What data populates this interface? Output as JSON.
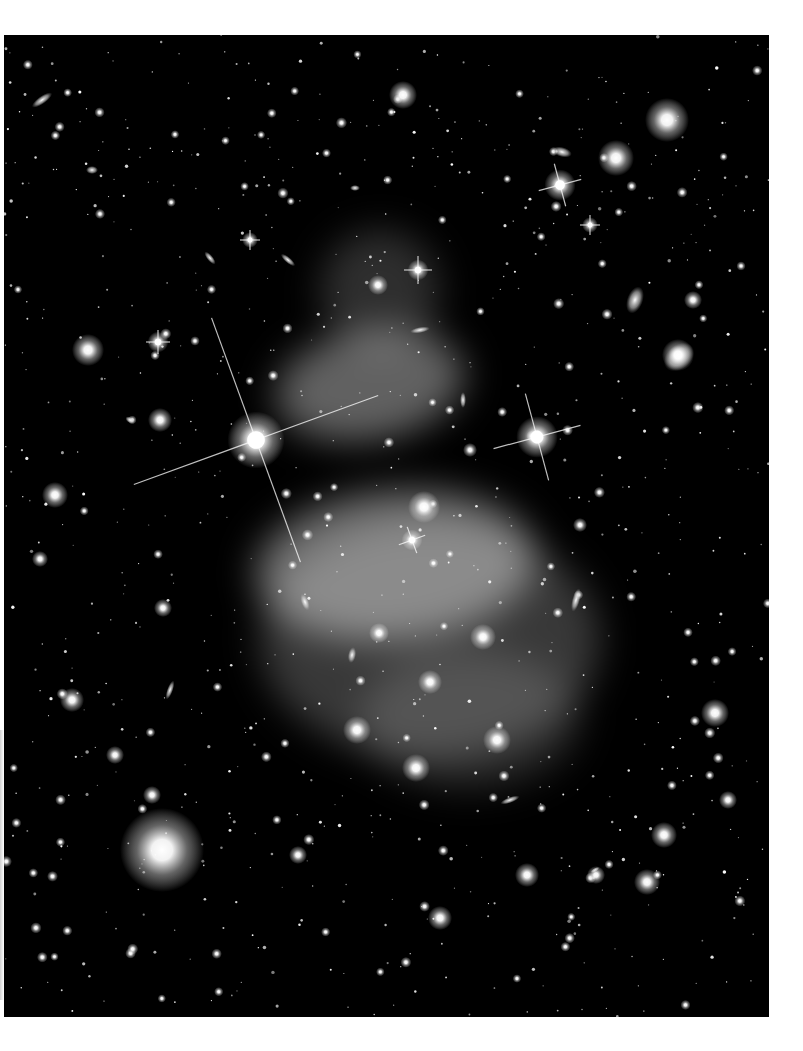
{
  "image": {
    "subject": "galaxy cluster deep field with intracluster light",
    "frame": {
      "x": 4,
      "y": 35,
      "width": 765,
      "height": 982,
      "background": "#000000"
    },
    "page_background": "#ffffff"
  },
  "nebula_glow": [
    {
      "cx": 370,
      "cy": 385,
      "rx": 95,
      "ry": 55,
      "opacity": 0.38,
      "rotate": -10
    },
    {
      "cx": 395,
      "cy": 565,
      "rx": 140,
      "ry": 75,
      "opacity": 0.42,
      "rotate": -5
    },
    {
      "cx": 430,
      "cy": 640,
      "rx": 170,
      "ry": 120,
      "opacity": 0.22,
      "rotate": 0
    },
    {
      "cx": 380,
      "cy": 290,
      "rx": 60,
      "ry": 60,
      "opacity": 0.18,
      "rotate": 0
    },
    {
      "cx": 470,
      "cy": 720,
      "rx": 110,
      "ry": 70,
      "opacity": 0.14,
      "rotate": 0
    }
  ],
  "spiked_stars": [
    {
      "cx": 256,
      "cy": 440,
      "r": 11,
      "spike": 130,
      "angle": -20
    },
    {
      "cx": 537,
      "cy": 437,
      "r": 8,
      "spike": 45,
      "angle": -15
    },
    {
      "cx": 560,
      "cy": 185,
      "r": 6,
      "spike": 22,
      "angle": -15
    },
    {
      "cx": 418,
      "cy": 270,
      "r": 4,
      "spike": 14,
      "angle": 0
    },
    {
      "cx": 158,
      "cy": 342,
      "r": 4,
      "spike": 12,
      "angle": 0
    },
    {
      "cx": 412,
      "cy": 540,
      "r": 4,
      "spike": 14,
      "angle": -20
    },
    {
      "cx": 590,
      "cy": 225,
      "r": 3,
      "spike": 10,
      "angle": 0
    },
    {
      "cx": 250,
      "cy": 240,
      "r": 3,
      "spike": 10,
      "angle": 0
    }
  ],
  "bright_halos": [
    {
      "cx": 162,
      "cy": 850,
      "r": 42
    },
    {
      "cx": 667,
      "cy": 120,
      "r": 22
    },
    {
      "cx": 616,
      "cy": 158,
      "r": 18
    },
    {
      "cx": 403,
      "cy": 95,
      "r": 14
    },
    {
      "cx": 88,
      "cy": 350,
      "r": 16
    },
    {
      "cx": 55,
      "cy": 495,
      "r": 13
    },
    {
      "cx": 160,
      "cy": 420,
      "r": 12
    },
    {
      "cx": 72,
      "cy": 700,
      "r": 12
    },
    {
      "cx": 357,
      "cy": 730,
      "r": 14
    },
    {
      "cx": 416,
      "cy": 768,
      "r": 14
    },
    {
      "cx": 483,
      "cy": 637,
      "r": 13
    },
    {
      "cx": 497,
      "cy": 740,
      "r": 14
    },
    {
      "cx": 430,
      "cy": 682,
      "r": 12
    },
    {
      "cx": 379,
      "cy": 633,
      "r": 10
    },
    {
      "cx": 424,
      "cy": 507,
      "r": 16
    },
    {
      "cx": 378,
      "cy": 285,
      "r": 10
    },
    {
      "cx": 715,
      "cy": 713,
      "r": 14
    },
    {
      "cx": 664,
      "cy": 835,
      "r": 13
    },
    {
      "cx": 647,
      "cy": 882,
      "r": 13
    },
    {
      "cx": 440,
      "cy": 918,
      "r": 12
    },
    {
      "cx": 527,
      "cy": 875,
      "r": 12
    },
    {
      "cx": 596,
      "cy": 875,
      "r": 9
    },
    {
      "cx": 693,
      "cy": 300,
      "r": 9
    },
    {
      "cx": 678,
      "cy": 355,
      "r": 16
    },
    {
      "cx": 163,
      "cy": 608,
      "r": 9
    },
    {
      "cx": 115,
      "cy": 755,
      "r": 9
    },
    {
      "cx": 152,
      "cy": 795,
      "r": 9
    },
    {
      "cx": 298,
      "cy": 855,
      "r": 9
    },
    {
      "cx": 40,
      "cy": 559,
      "r": 8
    },
    {
      "cx": 728,
      "cy": 800,
      "r": 9
    },
    {
      "cx": 580,
      "cy": 525,
      "r": 7
    },
    {
      "cx": 470,
      "cy": 450,
      "r": 7
    }
  ],
  "elongated_galaxies": [
    {
      "cx": 42,
      "cy": 100,
      "rx": 12,
      "ry": 4,
      "rotate": -35
    },
    {
      "cx": 679,
      "cy": 357,
      "rx": 17,
      "ry": 12,
      "rotate": -40
    },
    {
      "cx": 635,
      "cy": 300,
      "rx": 8,
      "ry": 14,
      "rotate": 20
    },
    {
      "cx": 562,
      "cy": 152,
      "rx": 10,
      "ry": 5,
      "rotate": 15
    },
    {
      "cx": 576,
      "cy": 600,
      "rx": 4,
      "ry": 12,
      "rotate": 15
    },
    {
      "cx": 510,
      "cy": 800,
      "rx": 10,
      "ry": 3,
      "rotate": -20
    },
    {
      "cx": 170,
      "cy": 690,
      "rx": 3,
      "ry": 10,
      "rotate": 20
    },
    {
      "cx": 130,
      "cy": 420,
      "rx": 5,
      "ry": 3,
      "rotate": 30
    },
    {
      "cx": 420,
      "cy": 330,
      "rx": 10,
      "ry": 3,
      "rotate": -10
    },
    {
      "cx": 463,
      "cy": 400,
      "rx": 3,
      "ry": 8,
      "rotate": 0
    },
    {
      "cx": 305,
      "cy": 602,
      "rx": 4,
      "ry": 9,
      "rotate": -20
    },
    {
      "cx": 210,
      "cy": 258,
      "rx": 3,
      "ry": 8,
      "rotate": -40
    },
    {
      "cx": 288,
      "cy": 260,
      "rx": 9,
      "ry": 3,
      "rotate": 40
    },
    {
      "cx": 355,
      "cy": 188,
      "rx": 5,
      "ry": 3,
      "rotate": 0
    },
    {
      "cx": 352,
      "cy": 655,
      "rx": 4,
      "ry": 8,
      "rotate": 10
    },
    {
      "cx": 595,
      "cy": 870,
      "rx": 5,
      "ry": 2,
      "rotate": -30
    },
    {
      "cx": 92,
      "cy": 170,
      "rx": 6,
      "ry": 4,
      "rotate": 0
    }
  ],
  "star_field": {
    "count": 900,
    "seed": 7,
    "min_r": 0.6,
    "max_r": 2.6,
    "color": "#ffffff"
  }
}
